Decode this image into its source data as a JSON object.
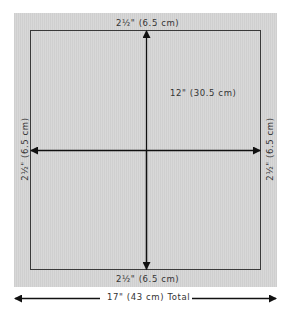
{
  "diagram": {
    "labels": {
      "top_margin": "2½\" (6.5 cm)",
      "bottom_margin": "2½\" (6.5 cm)",
      "left_margin": "2½\" (6.5 cm)",
      "right_margin": "2½\" (6.5 cm)",
      "inner_height": "12\" (30.5 cm)",
      "total_width": "17\" (43 cm) Total"
    },
    "colors": {
      "panel": "#d4d4d4",
      "lines": "#111111",
      "text": "#333333"
    }
  }
}
